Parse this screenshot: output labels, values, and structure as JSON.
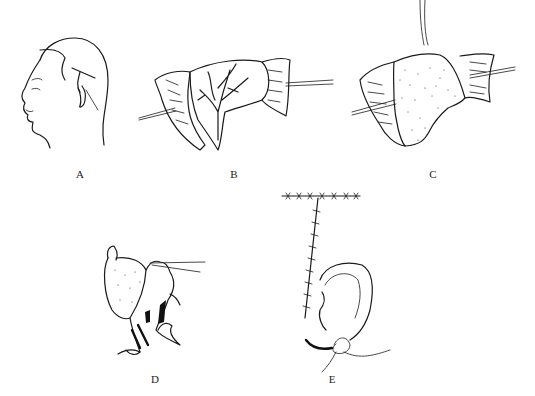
{
  "figure": {
    "panels": [
      {
        "id": "A",
        "label": "A",
        "description": "Side profile of head showing T-shaped incision marking behind ear"
      },
      {
        "id": "B",
        "label": "B",
        "description": "Skin flap raised with branching vessels exposed, retracted by hooks"
      },
      {
        "id": "C",
        "label": "C",
        "description": "Stippled fascia/graft sutured into place, retracted by hooks"
      },
      {
        "id": "D",
        "label": "D",
        "description": "Stippled flap folded over ear framework with retractor"
      },
      {
        "id": "E",
        "label": "E",
        "description": "Reconstructed ear with T-shaped sutured incision line"
      }
    ]
  }
}
